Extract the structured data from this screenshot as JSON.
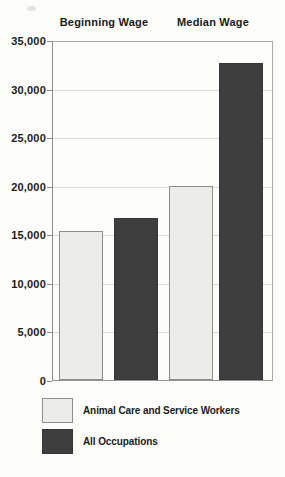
{
  "chart_data": {
    "type": "bar",
    "group_labels": [
      "Beginning Wage",
      "Median Wage"
    ],
    "series": [
      {
        "name": "Animal Care and Service Workers",
        "values": [
          15300,
          20000
        ],
        "color": "#ecece8",
        "border": "#8d8d8d",
        "swatch": "light"
      },
      {
        "name": "All Occupations",
        "values": [
          16700,
          32600
        ],
        "color": "#3e3e3e",
        "border": "#363636",
        "swatch": "dark"
      }
    ],
    "ylabel": "",
    "xlabel": "",
    "ylim": [
      0,
      35000
    ],
    "ytick_step": 5000,
    "ytick_labels": [
      "0",
      "5,000",
      "10,000",
      "15,000",
      "20,000",
      "25,000",
      "30,000",
      "35,000"
    ],
    "grid": true,
    "legend_position": "bottom"
  },
  "colors": {
    "light_bar_fill": "#ecece8",
    "light_bar_border": "#8d8d8d",
    "dark_bar_fill": "#3e3e3e",
    "gridline": "#dddbd6",
    "plot_border": "#ada9a4",
    "text": "#1b1b1b",
    "background": "#fcfcfa"
  }
}
